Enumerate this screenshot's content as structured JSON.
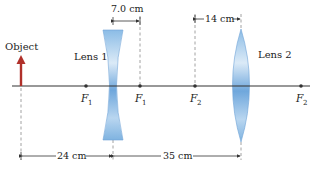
{
  "diagram": {
    "colors": {
      "axis": "#333333",
      "object": "#b0302a",
      "lens": "#7fb3e0",
      "lens_edge": "#5b95cc",
      "dash": "#888888",
      "text": "#222222"
    },
    "object": {
      "label": "Object"
    },
    "lenses": [
      {
        "id": "lens1",
        "label": "Lens 1",
        "type": "diverging"
      },
      {
        "id": "lens2",
        "label": "Lens 2",
        "type": "converging"
      }
    ],
    "focal_points": [
      {
        "letter": "F",
        "sub": "1",
        "near": "lens1",
        "side": "left"
      },
      {
        "letter": "F",
        "sub": "1",
        "near": "lens1",
        "side": "right"
      },
      {
        "letter": "F",
        "sub": "2",
        "near": "lens2",
        "side": "left"
      },
      {
        "letter": "F",
        "sub": "2",
        "near": "lens2",
        "side": "right"
      }
    ],
    "dimensions": {
      "focal1": "7.0 cm",
      "focal2": "14 cm",
      "object_to_lens1": "24 cm",
      "lens1_to_lens2": "35 cm"
    }
  }
}
